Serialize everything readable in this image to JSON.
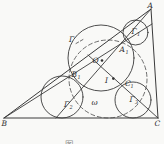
{
  "figure": {
    "type": "geometry-diagram",
    "colors": {
      "background": "#f9f9f7",
      "ink": "#3a3a3a",
      "caption": "#8d8d8d"
    },
    "labels": {
      "A": "A",
      "B": "B",
      "C": "C",
      "Gamma": "Γ",
      "Gamma1": {
        "main": "Γ",
        "sub": "1"
      },
      "Gamma2": {
        "main": "Γ",
        "sub": "2"
      },
      "Gamma3": {
        "main": "Γ",
        "sub": "3"
      },
      "A1": {
        "main": "A",
        "sub": "1"
      },
      "B1": {
        "main": "B",
        "sub": "1"
      },
      "C1": {
        "main": "C",
        "sub": "1"
      },
      "O": "O",
      "I": "I",
      "omega": "ω"
    },
    "caption": "图"
  }
}
